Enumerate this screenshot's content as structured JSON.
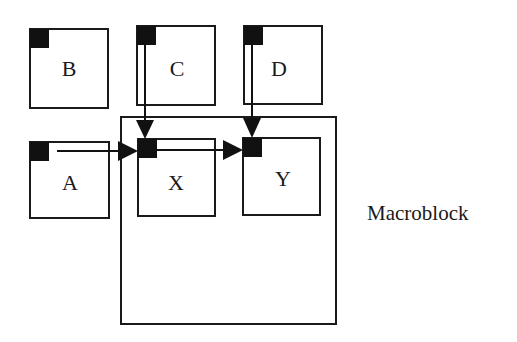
{
  "diagram": {
    "caption": "Macroblock",
    "blocks": [
      {
        "id": "B",
        "label": "B"
      },
      {
        "id": "C",
        "label": "C"
      },
      {
        "id": "D",
        "label": "D"
      },
      {
        "id": "A",
        "label": "A"
      },
      {
        "id": "X",
        "label": "X"
      },
      {
        "id": "Y",
        "label": "Y"
      }
    ],
    "edges": [
      {
        "from": "A",
        "to": "X"
      },
      {
        "from": "X",
        "to": "Y"
      },
      {
        "from": "C",
        "to": "X"
      },
      {
        "from": "D",
        "to": "Y"
      }
    ],
    "colors": {
      "stroke": "#1a1a1a",
      "fill": "#111111",
      "background": "#ffffff"
    }
  }
}
